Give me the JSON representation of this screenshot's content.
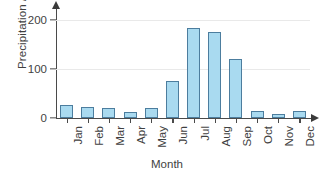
{
  "chart_data": {
    "type": "bar",
    "title": "",
    "xlabel": "Month",
    "ylabel": "Precipitation / mm",
    "categories": [
      "Jan",
      "Feb",
      "Mar",
      "Apr",
      "May",
      "Jun",
      "Jul",
      "Aug",
      "Sep",
      "Oct",
      "Nov",
      "Dec"
    ],
    "values": [
      26,
      22,
      20,
      12,
      20,
      75,
      183,
      175,
      120,
      14,
      8,
      15
    ],
    "ylim": [
      0,
      200
    ],
    "yticks": [
      0,
      100,
      200
    ],
    "ytick_labels": [
      "0",
      "100",
      "200"
    ],
    "grid": true,
    "grid_axis": "y",
    "legend": false,
    "legend_position": "none",
    "axes_arrows": true,
    "xtick_label_rotation": -90,
    "colors": {
      "bar_fill": "#a9daf0",
      "bar_border": "#4c7d9e",
      "axis": "#4a4a4a",
      "grid": "#e9e9e9",
      "text": "#3f3f3f",
      "background": "#ffffff"
    }
  }
}
